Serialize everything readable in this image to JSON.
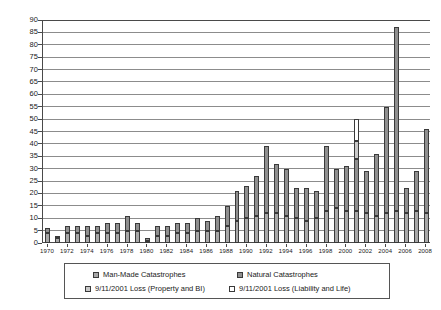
{
  "chart_data": {
    "type": "bar",
    "subtype": "stacked-column",
    "title": "",
    "xlabel": "",
    "ylabel": "",
    "ylim": [
      0,
      90
    ],
    "ytick_step": 5,
    "grid": true,
    "legend_position": "bottom",
    "yticks": [
      "0",
      "5",
      "10",
      "15",
      "20",
      "25",
      "30",
      "35",
      "40",
      "45",
      "50",
      "55",
      "60",
      "65",
      "70",
      "75",
      "80",
      "85",
      "90"
    ],
    "categories": [
      "1970",
      "1971",
      "1972",
      "1973",
      "1974",
      "1975",
      "1976",
      "1977",
      "1978",
      "1979",
      "1980",
      "1981",
      "1982",
      "1983",
      "1984",
      "1985",
      "1986",
      "1987",
      "1988",
      "1989",
      "1990",
      "1991",
      "1992",
      "1993",
      "1994",
      "1995",
      "1996",
      "1997",
      "1998",
      "1999",
      "2000",
      "2001",
      "2002",
      "2003",
      "2004",
      "2005",
      "2006",
      "2007",
      "2008"
    ],
    "xtick_labels": [
      "1970",
      "1972",
      "1974",
      "1976",
      "1978",
      "1980",
      "1982",
      "1984",
      "1986",
      "1988",
      "1990",
      "1992",
      "1994",
      "1996",
      "1998",
      "2000",
      "2002",
      "2004",
      "2006",
      "2008"
    ],
    "series": [
      {
        "name": "Man-Made Catastrophes",
        "color": "#a8a8a8",
        "values": [
          4,
          2,
          4,
          4,
          3,
          4,
          4,
          4,
          5,
          5,
          1,
          3,
          3,
          4,
          4,
          5,
          5,
          5,
          7,
          9,
          10,
          11,
          12,
          12,
          11,
          10,
          9,
          10,
          13,
          14,
          13,
          13,
          12,
          11,
          12,
          13,
          12,
          13,
          12
        ]
      },
      {
        "name": "Natural Catastrophes",
        "color": "#8f8f8f",
        "values": [
          2,
          1,
          3,
          3,
          4,
          3,
          4,
          4,
          6,
          3,
          1,
          4,
          4,
          4,
          4,
          5,
          4,
          6,
          8,
          12,
          13,
          16,
          27,
          20,
          19,
          12,
          13,
          11,
          26,
          16,
          18,
          21,
          17,
          25,
          43,
          74,
          10,
          16,
          34
        ]
      },
      {
        "name": "9/11/2001 Loss (Property and BI)",
        "color": "#c9c9c9",
        "values": [
          0,
          0,
          0,
          0,
          0,
          0,
          0,
          0,
          0,
          0,
          0,
          0,
          0,
          0,
          0,
          0,
          0,
          0,
          0,
          0,
          0,
          0,
          0,
          0,
          0,
          0,
          0,
          0,
          0,
          0,
          0,
          7,
          0,
          0,
          0,
          0,
          0,
          0,
          0
        ]
      },
      {
        "name": "9/11/2001 Loss (Liability and Life)",
        "color": "#ffffff",
        "values": [
          0,
          0,
          0,
          0,
          0,
          0,
          0,
          0,
          0,
          0,
          0,
          0,
          0,
          0,
          0,
          0,
          0,
          0,
          0,
          0,
          0,
          0,
          0,
          0,
          0,
          0,
          0,
          0,
          0,
          0,
          0,
          9,
          0,
          0,
          0,
          0,
          0,
          0,
          0
        ]
      }
    ],
    "totals": [
      6,
      3,
      7,
      7,
      7,
      7,
      8,
      8,
      11,
      8,
      2,
      7,
      7,
      8,
      8,
      10,
      9,
      11,
      15,
      21,
      23,
      27,
      39,
      32,
      30,
      22,
      22,
      21,
      39,
      30,
      31,
      50,
      29,
      36,
      55,
      87,
      22,
      29,
      46
    ]
  },
  "legend": {
    "items": [
      {
        "label": "Man-Made Catastrophes",
        "swatch": "sw-manmade"
      },
      {
        "label": "Natural Catastrophes",
        "swatch": "sw-natural"
      },
      {
        "label": "9/11/2001 Loss (Property and BI)",
        "swatch": "sw-prop"
      },
      {
        "label": "9/11/2001 Loss (Liability and Life)",
        "swatch": "sw-liab"
      }
    ]
  }
}
